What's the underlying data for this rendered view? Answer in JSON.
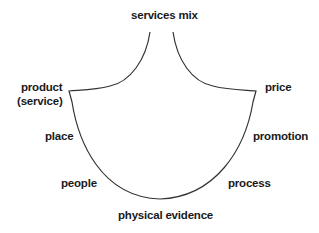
{
  "diagram": {
    "title": "services mix",
    "labels": {
      "product": "product",
      "product_sub": "(service)",
      "price": "price",
      "place": "place",
      "promotion": "promotion",
      "people": "people",
      "process": "process",
      "physical_evidence": "physical evidence"
    },
    "stroke_color": "#333333"
  }
}
